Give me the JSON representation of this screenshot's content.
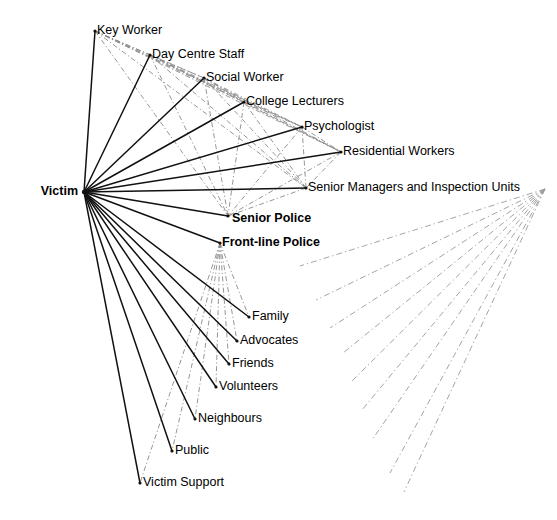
{
  "diagram": {
    "type": "sociogram",
    "background_color": "#ffffff",
    "solid_edge_color": "#111111",
    "dashed_edge_color": "#8a8a8a",
    "hub": {
      "id": "victim",
      "label": "Victim",
      "bold": true,
      "x": 84,
      "y": 192,
      "label_anchor": "end",
      "label_x": 78,
      "label_y": 192
    },
    "right_hub": {
      "id": "right-fan-origin",
      "x": 545,
      "y": 189
    },
    "nodes": [
      {
        "id": "key-worker",
        "label": "Key Worker",
        "bold": false,
        "x": 95,
        "y": 31,
        "label_x": 97,
        "label_y": 31
      },
      {
        "id": "day-centre-staff",
        "label": "Day Centre Staff",
        "bold": false,
        "x": 150,
        "y": 55,
        "label_x": 152,
        "label_y": 55
      },
      {
        "id": "social-worker",
        "label": "Social Worker",
        "bold": false,
        "x": 204,
        "y": 78,
        "label_x": 206,
        "label_y": 78
      },
      {
        "id": "college-lecturers",
        "label": "College Lecturers",
        "bold": false,
        "x": 244,
        "y": 102,
        "label_x": 246,
        "label_y": 102
      },
      {
        "id": "psychologist",
        "label": "Psychologist",
        "bold": false,
        "x": 302,
        "y": 127,
        "label_x": 304,
        "label_y": 127
      },
      {
        "id": "residential-workers",
        "label": "Residential Workers",
        "bold": false,
        "x": 341,
        "y": 152,
        "label_x": 343,
        "label_y": 152
      },
      {
        "id": "senior-managers",
        "label": "Senior Managers and Inspection Units",
        "bold": false,
        "x": 306,
        "y": 188,
        "label_x": 308,
        "label_y": 188
      },
      {
        "id": "senior-police",
        "label": "Senior Police",
        "bold": true,
        "x": 228,
        "y": 216,
        "label_x": 232,
        "label_y": 219
      },
      {
        "id": "front-line-police",
        "label": "Front-line Police",
        "bold": true,
        "x": 220,
        "y": 243,
        "label_x": 222,
        "label_y": 243
      },
      {
        "id": "family",
        "label": "Family",
        "bold": false,
        "x": 249,
        "y": 317,
        "label_x": 252,
        "label_y": 317
      },
      {
        "id": "advocates",
        "label": "Advocates",
        "bold": false,
        "x": 237,
        "y": 341,
        "label_x": 240,
        "label_y": 341
      },
      {
        "id": "friends",
        "label": "Friends",
        "bold": false,
        "x": 229,
        "y": 364,
        "label_x": 232,
        "label_y": 364
      },
      {
        "id": "volunteers",
        "label": "Volunteers",
        "bold": false,
        "x": 216,
        "y": 387,
        "label_x": 219,
        "label_y": 387
      },
      {
        "id": "neighbours",
        "label": "Neighbours",
        "bold": false,
        "x": 195,
        "y": 419,
        "label_x": 198,
        "label_y": 419
      },
      {
        "id": "public",
        "label": "Public",
        "bold": false,
        "x": 172,
        "y": 451,
        "label_x": 175,
        "label_y": 451
      },
      {
        "id": "victim-support",
        "label": "Victim Support",
        "bold": false,
        "x": 140,
        "y": 483,
        "label_x": 143,
        "label_y": 483
      }
    ],
    "solid_edges": [
      {
        "from": "victim",
        "to": "key-worker"
      },
      {
        "from": "victim",
        "to": "day-centre-staff"
      },
      {
        "from": "victim",
        "to": "social-worker"
      },
      {
        "from": "victim",
        "to": "college-lecturers"
      },
      {
        "from": "victim",
        "to": "psychologist"
      },
      {
        "from": "victim",
        "to": "residential-workers"
      },
      {
        "from": "victim",
        "to": "senior-managers"
      },
      {
        "from": "victim",
        "to": "senior-police"
      },
      {
        "from": "victim",
        "to": "front-line-police"
      },
      {
        "from": "victim",
        "to": "family"
      },
      {
        "from": "victim",
        "to": "advocates"
      },
      {
        "from": "victim",
        "to": "friends"
      },
      {
        "from": "victim",
        "to": "volunteers"
      },
      {
        "from": "victim",
        "to": "neighbours"
      },
      {
        "from": "victim",
        "to": "public"
      },
      {
        "from": "victim",
        "to": "victim-support"
      }
    ],
    "dashed_edges": [
      {
        "from": "key-worker",
        "to": "senior-police"
      },
      {
        "from": "key-worker",
        "to": "senior-managers"
      },
      {
        "from": "key-worker",
        "to": "residential-workers"
      },
      {
        "from": "key-worker",
        "to": "psychologist"
      },
      {
        "from": "key-worker",
        "to": "college-lecturers"
      },
      {
        "from": "key-worker",
        "to": "social-worker"
      },
      {
        "from": "key-worker",
        "to": "day-centre-staff"
      },
      {
        "from": "day-centre-staff",
        "to": "senior-police"
      },
      {
        "from": "day-centre-staff",
        "to": "senior-managers"
      },
      {
        "from": "day-centre-staff",
        "to": "residential-workers"
      },
      {
        "from": "day-centre-staff",
        "to": "psychologist"
      },
      {
        "from": "day-centre-staff",
        "to": "college-lecturers"
      },
      {
        "from": "day-centre-staff",
        "to": "social-worker"
      },
      {
        "from": "social-worker",
        "to": "senior-police"
      },
      {
        "from": "social-worker",
        "to": "senior-managers"
      },
      {
        "from": "social-worker",
        "to": "residential-workers"
      },
      {
        "from": "social-worker",
        "to": "psychologist"
      },
      {
        "from": "social-worker",
        "to": "college-lecturers"
      },
      {
        "from": "college-lecturers",
        "to": "senior-police"
      },
      {
        "from": "college-lecturers",
        "to": "senior-managers"
      },
      {
        "from": "college-lecturers",
        "to": "residential-workers"
      },
      {
        "from": "college-lecturers",
        "to": "psychologist"
      },
      {
        "from": "psychologist",
        "to": "senior-police"
      },
      {
        "from": "psychologist",
        "to": "senior-managers"
      },
      {
        "from": "psychologist",
        "to": "residential-workers"
      },
      {
        "from": "residential-workers",
        "to": "senior-police"
      },
      {
        "from": "residential-workers",
        "to": "senior-managers"
      },
      {
        "from": "senior-managers",
        "to": "senior-police"
      },
      {
        "from": "front-line-police",
        "to": "family"
      },
      {
        "from": "front-line-police",
        "to": "advocates"
      },
      {
        "from": "front-line-police",
        "to": "friends"
      },
      {
        "from": "front-line-police",
        "to": "volunteers"
      },
      {
        "from": "front-line-police",
        "to": "neighbours"
      },
      {
        "from": "front-line-police",
        "to": "public"
      },
      {
        "from": "front-line-police",
        "to": "victim-support"
      }
    ],
    "right_fan_edges": [
      {
        "x1": 545,
        "y1": 189,
        "x2": 300,
        "y2": 266
      },
      {
        "x1": 545,
        "y1": 189,
        "x2": 316,
        "y2": 300
      },
      {
        "x1": 545,
        "y1": 189,
        "x2": 330,
        "y2": 328
      },
      {
        "x1": 545,
        "y1": 189,
        "x2": 343,
        "y2": 353
      },
      {
        "x1": 545,
        "y1": 189,
        "x2": 352,
        "y2": 381
      },
      {
        "x1": 545,
        "y1": 189,
        "x2": 362,
        "y2": 410
      },
      {
        "x1": 545,
        "y1": 189,
        "x2": 372,
        "y2": 440
      },
      {
        "x1": 545,
        "y1": 189,
        "x2": 390,
        "y2": 473
      },
      {
        "x1": 545,
        "y1": 189,
        "x2": 404,
        "y2": 492
      }
    ]
  }
}
